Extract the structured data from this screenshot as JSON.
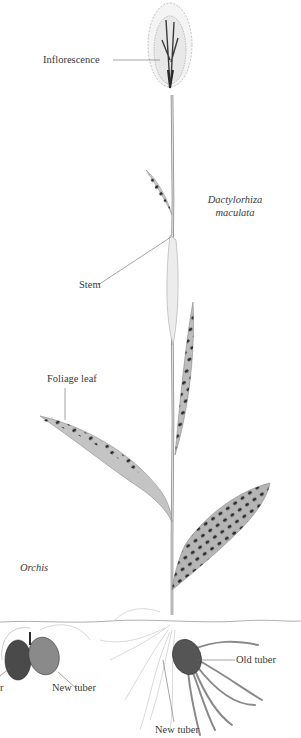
{
  "figure": {
    "type": "botanical-illustration",
    "colors": {
      "background": "#ffffff",
      "ink": "#3a3a3a",
      "leaf_fill": "#b9b9b9",
      "leaf_spots": "#2b2b2b",
      "tuber_dark": "#4a4a4a",
      "root": "#9a9a9a",
      "leader_line": "#6a6a6a"
    }
  },
  "species_labels": {
    "main_line1": "Dactylorhiza",
    "main_line2": "maculata",
    "secondary": "Orchis"
  },
  "part_labels": {
    "inflorescence": "Inflorescence",
    "stem": "Stem",
    "foliage_leaf": "Foliage leaf",
    "old_tuber_left_partial": "r",
    "new_tuber_left": "New tuber",
    "old_tuber_right": "Old tuber",
    "new_tuber_right": "New tuber"
  }
}
